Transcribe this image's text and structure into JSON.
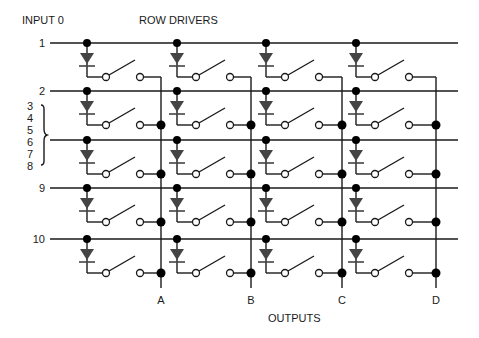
{
  "labels": {
    "input_title": "INPUT 0",
    "row_title": "ROW DRIVERS",
    "outputs_title": "OUTPUTS",
    "brace_inputs": [
      "3",
      "4",
      "5",
      "6",
      "7",
      "8"
    ]
  },
  "rows": [
    {
      "label": "1",
      "y": 43
    },
    {
      "label": "2",
      "y": 91
    },
    {
      "label": "",
      "y": 140
    },
    {
      "label": "9",
      "y": 188
    },
    {
      "label": "10",
      "y": 239
    }
  ],
  "columns": [
    {
      "label": "A",
      "node_x": 87,
      "output_x": 161
    },
    {
      "label": "B",
      "node_x": 177,
      "output_x": 251
    },
    {
      "label": "C",
      "node_x": 266,
      "output_x": 342
    },
    {
      "label": "D",
      "node_x": 356,
      "output_x": 436
    }
  ],
  "colors": {
    "wire": "#1a1a1a",
    "diode": "#444444",
    "background": "#ffffff"
  }
}
